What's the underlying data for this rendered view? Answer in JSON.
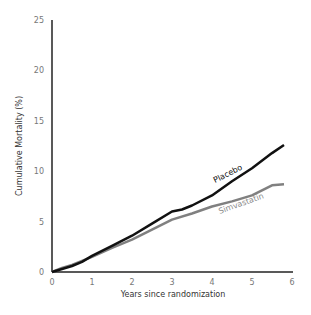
{
  "chart_data": {
    "type": "line",
    "title": "",
    "xlabel": "Years since randomization",
    "ylabel": "Cumulative Mortality (%)",
    "xlim": [
      0,
      6
    ],
    "ylim": [
      0,
      25
    ],
    "xticks": [
      0,
      1,
      2,
      3,
      4,
      5,
      6
    ],
    "yticks": [
      0,
      5,
      10,
      15,
      20,
      25
    ],
    "grid": false,
    "legend": "inline labels on curves",
    "series": [
      {
        "name": "Placebo",
        "color": "#111111",
        "x": [
          0,
          0.25,
          0.5,
          0.75,
          1,
          1.5,
          2,
          2.5,
          3,
          3.25,
          3.5,
          4,
          4.5,
          5,
          5.5,
          5.8
        ],
        "values": [
          0,
          0.3,
          0.6,
          1.0,
          1.6,
          2.6,
          3.6,
          4.8,
          6.0,
          6.2,
          6.6,
          7.6,
          9.0,
          10.3,
          11.8,
          12.6
        ]
      },
      {
        "name": "Simvastatin",
        "color": "#808080",
        "x": [
          0,
          0.25,
          0.5,
          0.75,
          1,
          1.5,
          2,
          2.5,
          3,
          3.5,
          4,
          4.5,
          5,
          5.5,
          5.8
        ],
        "values": [
          0,
          0.4,
          0.7,
          1.1,
          1.5,
          2.4,
          3.2,
          4.2,
          5.2,
          5.8,
          6.5,
          7.0,
          7.6,
          8.6,
          8.7
        ]
      }
    ]
  }
}
